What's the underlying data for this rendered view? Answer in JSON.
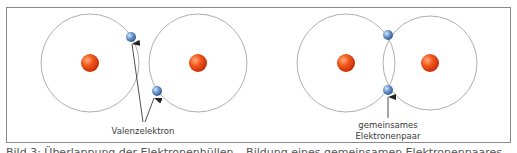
{
  "figure": {
    "left_panel": {
      "title": "separate atoms",
      "label": "Valenzelektron"
    },
    "right_panel": {
      "title": "bonded atoms",
      "label_line1": "gemeinsames",
      "label_line2": "Elektronenpaar"
    },
    "caption": "Bild 3: Überlappung der Elektronenhüllen – Bildung eines gemeinsamen Elektronenpaares",
    "colors": {
      "frame": "#8a8a8a",
      "orbit": "#9a9a9a",
      "nucleus_light": "#ff9a5a",
      "nucleus_dark": "#d0300c",
      "electron_light": "#a9c8ec",
      "electron_dark": "#2c5a94",
      "arrow": "#222222"
    }
  }
}
